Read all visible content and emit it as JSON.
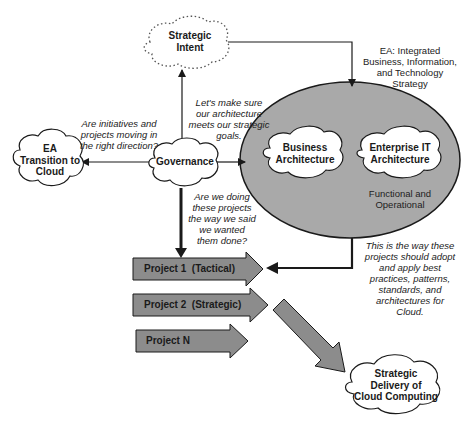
{
  "diagram": {
    "nodes": {
      "strategic_intent": {
        "label": "Strategic\nIntent",
        "line1": "Strategic",
        "line2": "Intent",
        "shape": "dashed-cloud"
      },
      "governance": {
        "label": "Governance",
        "shape": "cloud"
      },
      "ea_transition": {
        "line1": "EA",
        "line2": "Transition to",
        "line3": "Cloud",
        "shape": "cloud"
      },
      "business_architecture": {
        "line1": "Business",
        "line2": "Architecture",
        "shape": "cloud"
      },
      "enterprise_it_architecture": {
        "line1": "Enterprise IT",
        "line2": "Architecture",
        "shape": "cloud"
      },
      "functional_operational": {
        "line1": "Functional and",
        "line2": "Operational"
      },
      "strategic_delivery": {
        "line1": "Strategic",
        "line2": "Delivery of",
        "line3": "Cloud Computing",
        "shape": "cloud"
      }
    },
    "annotations": {
      "ea_integrated": {
        "line1": "EA:  Integrated",
        "line2": "Business, Information,",
        "line3": "and Technology",
        "line4": "Strategy"
      },
      "lets_make_sure": {
        "line1": "Let's make sure",
        "line2": "our architecture",
        "line3": "meets our strategic",
        "line4": "goals."
      },
      "are_initiatives": {
        "line1": "Are initiatives and",
        "line2": "projects moving in",
        "line3": "the right direction?"
      },
      "are_we_doing": {
        "line1": "Are we doing",
        "line2": "these projects",
        "line3": "the way we said",
        "line4": "we wanted",
        "line5": "them done?"
      },
      "this_is_the_way": {
        "line1": "This is the way these",
        "line2": "projects should adopt",
        "line3": "and apply best",
        "line4": "practices, patterns,",
        "line5": "standards, and",
        "line6": "architectures for",
        "line7": "Cloud."
      }
    },
    "projects": [
      {
        "label": "Project 1  (Tactical)"
      },
      {
        "label": "Project 2  (Strategic)"
      },
      {
        "label": "Project N"
      }
    ],
    "colors": {
      "ellipse_fill": "#a9a9a9",
      "arrow_fill": "#8c8c8c",
      "stroke": "#1a1a1a",
      "cloud_fill": "#ffffff"
    }
  }
}
